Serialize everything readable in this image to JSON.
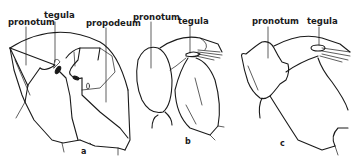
{
  "diagram": {
    "panels": [
      {
        "id": "a",
        "letter": "a",
        "labels": {
          "pronotum": "pronotum",
          "tegula": "tegula",
          "propodeum": "propodeum"
        }
      },
      {
        "id": "b",
        "letter": "b",
        "labels": {
          "pronotum": "pronotum",
          "tegula": "tegula"
        }
      },
      {
        "id": "c",
        "letter": "c",
        "labels": {
          "pronotum": "pronotum",
          "tegula": "tegula"
        }
      }
    ],
    "colors": {
      "ink": "#1a1a1a",
      "background": "#ffffff"
    }
  }
}
